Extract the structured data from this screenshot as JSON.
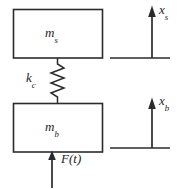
{
  "figure": {
    "type": "mechanical-schematic",
    "background_color": "#ffffff",
    "line_color": "#2b2b2b"
  },
  "masses": {
    "upper": {
      "label_text": "m",
      "label_subscript": "s",
      "meaning": "sprung mass"
    },
    "lower": {
      "label_text": "m",
      "label_subscript": "b",
      "meaning": "unsprung mass"
    }
  },
  "spring": {
    "label_text": "k",
    "label_subscript": "c",
    "meaning": "suspension stiffness",
    "coils": 6
  },
  "force": {
    "label_text": "F(t)",
    "direction": "up",
    "applied_to": "lower mass"
  },
  "displacements": [
    {
      "label_text": "x",
      "label_subscript": "s",
      "direction": "up",
      "reference": "upper mass"
    },
    {
      "label_text": "x",
      "label_subscript": "b",
      "direction": "up",
      "reference": "lower mass"
    }
  ]
}
